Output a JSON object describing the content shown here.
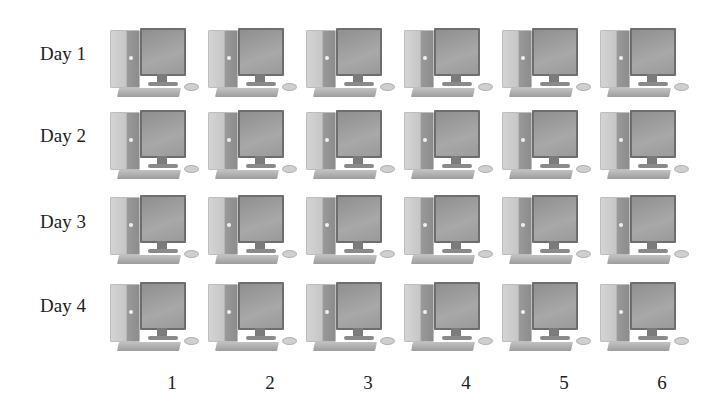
{
  "rows": [
    {
      "label": "Day 1"
    },
    {
      "label": "Day 2"
    },
    {
      "label": "Day 3"
    },
    {
      "label": "Day 4"
    }
  ],
  "columns": [
    {
      "label": "1"
    },
    {
      "label": "2"
    },
    {
      "label": "3"
    },
    {
      "label": "4"
    },
    {
      "label": "5"
    },
    {
      "label": "6"
    }
  ],
  "cell_icon": "desktop-computer-icon",
  "colors": {
    "background": "#ffffff",
    "text": "#222222",
    "icon": "#9a9a9a"
  }
}
